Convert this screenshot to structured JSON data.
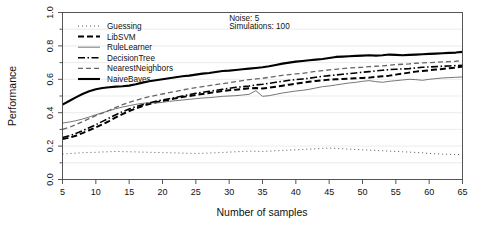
{
  "chart_data": {
    "type": "line",
    "title": "",
    "xlabel": "Number of samples",
    "ylabel": "Performance",
    "xlim": [
      5,
      65
    ],
    "ylim": [
      0.0,
      1.0
    ],
    "xticks": [
      5,
      10,
      15,
      20,
      25,
      30,
      35,
      40,
      45,
      50,
      55,
      60,
      65
    ],
    "xtick_labels": [
      "5",
      "10",
      "15",
      "20",
      "25",
      "30",
      "35",
      "40",
      "45",
      "50",
      "55",
      "60",
      "65"
    ],
    "yticks": [
      0.0,
      0.2,
      0.4,
      0.6,
      0.8,
      1.0
    ],
    "ytick_labels": [
      "0.0",
      "0.2",
      "0.4",
      "0.6",
      "0.8",
      "1.0"
    ],
    "yticks_minor": [
      0.1,
      0.3,
      0.5,
      0.7,
      0.9
    ],
    "grid": false,
    "legend_position": "top-left-inside",
    "annotations": [
      {
        "text": "Noise: 5",
        "x": 30,
        "y": 0.95
      },
      {
        "text": "Simulations: 100",
        "x": 30,
        "y": 0.9
      }
    ],
    "x": [
      5,
      6,
      7,
      8,
      9,
      10,
      11,
      12,
      13,
      14,
      15,
      16,
      17,
      18,
      19,
      20,
      21,
      22,
      23,
      24,
      25,
      26,
      27,
      28,
      29,
      30,
      31,
      32,
      33,
      34,
      35,
      36,
      37,
      38,
      39,
      40,
      41,
      42,
      43,
      44,
      45,
      46,
      47,
      48,
      49,
      50,
      51,
      52,
      53,
      54,
      55,
      56,
      57,
      58,
      59,
      60,
      61,
      62,
      63,
      64,
      65
    ],
    "series": [
      {
        "name": "Guessing",
        "style": "dotted",
        "color": "#555555",
        "width": 1.0,
        "dash": "1,3",
        "values": [
          0.152,
          0.155,
          0.158,
          0.16,
          0.162,
          0.163,
          0.165,
          0.166,
          0.168,
          0.167,
          0.166,
          0.165,
          0.164,
          0.163,
          0.162,
          0.161,
          0.16,
          0.159,
          0.158,
          0.157,
          0.156,
          0.157,
          0.158,
          0.16,
          0.162,
          0.164,
          0.166,
          0.168,
          0.17,
          0.169,
          0.168,
          0.17,
          0.172,
          0.174,
          0.176,
          0.178,
          0.18,
          0.182,
          0.184,
          0.186,
          0.188,
          0.186,
          0.184,
          0.182,
          0.18,
          0.178,
          0.176,
          0.174,
          0.172,
          0.17,
          0.168,
          0.166,
          0.164,
          0.162,
          0.16,
          0.156,
          0.154,
          0.152,
          0.151,
          0.15,
          0.149
        ]
      },
      {
        "name": "LibSVM",
        "style": "dashed-heavy",
        "color": "#000000",
        "width": 2.0,
        "dash": "6,3",
        "values": [
          0.243,
          0.25,
          0.262,
          0.278,
          0.295,
          0.312,
          0.33,
          0.35,
          0.372,
          0.392,
          0.41,
          0.425,
          0.44,
          0.452,
          0.462,
          0.47,
          0.478,
          0.486,
          0.494,
          0.5,
          0.506,
          0.512,
          0.518,
          0.524,
          0.53,
          0.534,
          0.538,
          0.542,
          0.546,
          0.548,
          0.545,
          0.55,
          0.556,
          0.562,
          0.568,
          0.574,
          0.58,
          0.586,
          0.59,
          0.594,
          0.598,
          0.6,
          0.602,
          0.604,
          0.606,
          0.608,
          0.61,
          0.614,
          0.618,
          0.622,
          0.628,
          0.634,
          0.64,
          0.646,
          0.65,
          0.654,
          0.658,
          0.662,
          0.666,
          0.67,
          0.676
        ]
      },
      {
        "name": "RuleLearner",
        "style": "solid-thin",
        "color": "#777777",
        "width": 1.0,
        "dash": "",
        "values": [
          0.338,
          0.344,
          0.352,
          0.362,
          0.374,
          0.388,
          0.4,
          0.412,
          0.424,
          0.434,
          0.442,
          0.45,
          0.456,
          0.46,
          0.458,
          0.462,
          0.468,
          0.472,
          0.476,
          0.48,
          0.484,
          0.488,
          0.49,
          0.494,
          0.498,
          0.5,
          0.502,
          0.506,
          0.51,
          0.532,
          0.498,
          0.502,
          0.51,
          0.518,
          0.524,
          0.53,
          0.534,
          0.54,
          0.548,
          0.556,
          0.56,
          0.566,
          0.572,
          0.578,
          0.582,
          0.588,
          0.592,
          0.586,
          0.582,
          0.588,
          0.592,
          0.596,
          0.6,
          0.598,
          0.594,
          0.6,
          0.604,
          0.608,
          0.61,
          0.612,
          0.614
        ]
      },
      {
        "name": "DecisionTree",
        "style": "dash-dot",
        "color": "#000000",
        "width": 1.6,
        "dash": "7,2.5,1.5,2.5",
        "values": [
          0.252,
          0.262,
          0.276,
          0.292,
          0.31,
          0.328,
          0.348,
          0.368,
          0.388,
          0.406,
          0.422,
          0.436,
          0.448,
          0.458,
          0.468,
          0.476,
          0.484,
          0.492,
          0.5,
          0.508,
          0.516,
          0.522,
          0.528,
          0.534,
          0.54,
          0.546,
          0.552,
          0.556,
          0.56,
          0.566,
          0.57,
          0.576,
          0.582,
          0.588,
          0.594,
          0.598,
          0.602,
          0.606,
          0.612,
          0.618,
          0.622,
          0.626,
          0.63,
          0.634,
          0.638,
          0.642,
          0.646,
          0.65,
          0.654,
          0.658,
          0.66,
          0.662,
          0.664,
          0.668,
          0.672,
          0.674,
          0.676,
          0.678,
          0.68,
          0.682,
          0.684
        ]
      },
      {
        "name": "NearestNeighbors",
        "style": "long-dash",
        "color": "#666666",
        "width": 1.3,
        "dash": "5,3",
        "values": [
          0.3,
          0.312,
          0.328,
          0.346,
          0.364,
          0.382,
          0.398,
          0.414,
          0.432,
          0.448,
          0.462,
          0.474,
          0.486,
          0.496,
          0.504,
          0.512,
          0.52,
          0.528,
          0.536,
          0.544,
          0.55,
          0.556,
          0.562,
          0.568,
          0.574,
          0.58,
          0.586,
          0.592,
          0.598,
          0.602,
          0.606,
          0.612,
          0.618,
          0.624,
          0.628,
          0.632,
          0.636,
          0.642,
          0.648,
          0.652,
          0.656,
          0.66,
          0.664,
          0.668,
          0.67,
          0.672,
          0.676,
          0.678,
          0.68,
          0.684,
          0.688,
          0.69,
          0.692,
          0.696,
          0.698,
          0.7,
          0.702,
          0.704,
          0.706,
          0.708,
          0.712
        ]
      },
      {
        "name": "NaiveBayes",
        "style": "solid-heavy",
        "color": "#000000",
        "width": 2.1,
        "dash": "",
        "values": [
          0.448,
          0.47,
          0.492,
          0.512,
          0.528,
          0.54,
          0.548,
          0.552,
          0.556,
          0.558,
          0.562,
          0.57,
          0.58,
          0.588,
          0.594,
          0.6,
          0.606,
          0.612,
          0.618,
          0.622,
          0.628,
          0.634,
          0.638,
          0.644,
          0.65,
          0.652,
          0.656,
          0.66,
          0.664,
          0.668,
          0.672,
          0.678,
          0.686,
          0.694,
          0.7,
          0.706,
          0.71,
          0.714,
          0.718,
          0.722,
          0.728,
          0.734,
          0.736,
          0.738,
          0.74,
          0.742,
          0.744,
          0.742,
          0.744,
          0.748,
          0.746,
          0.744,
          0.746,
          0.748,
          0.75,
          0.752,
          0.754,
          0.756,
          0.758,
          0.76,
          0.764
        ]
      }
    ]
  }
}
